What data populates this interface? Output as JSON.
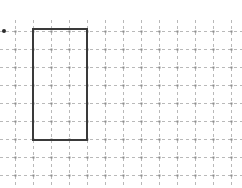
{
  "figure": {
    "title": "",
    "background_color": "#ffffff",
    "width": 242,
    "height": 188
  },
  "grid": {
    "style": "dashed",
    "color": "#b9b9b9",
    "node_color": "#8d8d8d",
    "spacing_px": 18,
    "origin_x_px": 15,
    "origin_y_px": 31,
    "vertical_lines_x": [
      15,
      33,
      51,
      69,
      87,
      105,
      123,
      141,
      159,
      177,
      195,
      213,
      231
    ],
    "horizontal_lines_y": [
      31,
      49,
      67,
      85,
      103,
      121,
      139,
      157,
      175
    ],
    "vertical_extent_y": [
      20,
      188
    ],
    "horizontal_extent_x": [
      0,
      242
    ],
    "columns": 12,
    "rows": 8
  },
  "markers": {
    "origin_dot": {
      "label": "origin-dot",
      "x_px": 4,
      "y_px": 31,
      "radius_px": 2,
      "color": "#2b2b2b"
    }
  },
  "shapes": [
    {
      "name": "rectangle",
      "type": "rectangle",
      "stroke_color": "#3a3a3a",
      "stroke_width_px": 2,
      "fill": "none",
      "x_px": 33,
      "y_px": 29,
      "width_px": 54,
      "height_px": 111,
      "grid_units": {
        "x": 1,
        "y": 0,
        "width": 3,
        "height": 6
      },
      "corners_px": [
        [
          33,
          29
        ],
        [
          87,
          29
        ],
        [
          87,
          140
        ],
        [
          33,
          140
        ]
      ]
    }
  ]
}
